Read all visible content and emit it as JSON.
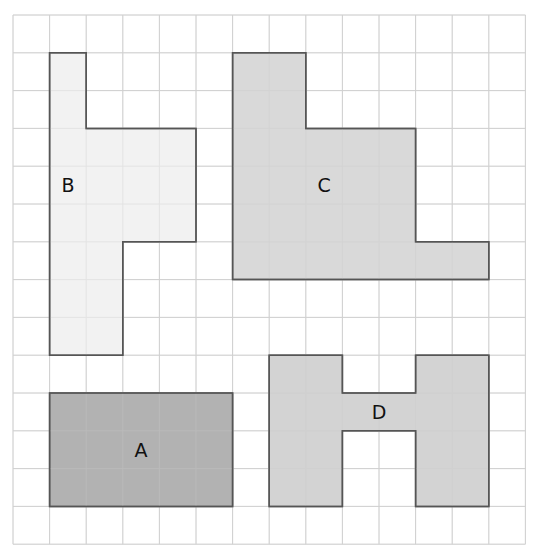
{
  "grid": {
    "origin_x": 13,
    "origin_y": 15,
    "cols": 14,
    "rows": 14,
    "cell_w": 36.6,
    "cell_h": 37.8,
    "line_color": "#d0d0d0",
    "background": "#ffffff"
  },
  "shapes": [
    {
      "id": "B",
      "label": "B",
      "fill": "#f1f1f1",
      "stroke": "#555555",
      "points": [
        [
          1,
          1
        ],
        [
          2,
          1
        ],
        [
          2,
          3
        ],
        [
          5,
          3
        ],
        [
          5,
          6
        ],
        [
          3,
          6
        ],
        [
          3,
          9
        ],
        [
          1,
          9
        ]
      ],
      "label_pos": [
        1.5,
        4.5
      ]
    },
    {
      "id": "C",
      "label": "C",
      "fill": "#d6d6d6",
      "stroke": "#555555",
      "points": [
        [
          6,
          1
        ],
        [
          8,
          1
        ],
        [
          8,
          3
        ],
        [
          11,
          3
        ],
        [
          11,
          6
        ],
        [
          13,
          6
        ],
        [
          13,
          7
        ],
        [
          6,
          7
        ]
      ],
      "label_pos": [
        8.5,
        4.5
      ]
    },
    {
      "id": "A",
      "label": "A",
      "fill": "#ababab",
      "stroke": "#555555",
      "points": [
        [
          1,
          10
        ],
        [
          6,
          10
        ],
        [
          6,
          13
        ],
        [
          1,
          13
        ]
      ],
      "label_pos": [
        3.5,
        11.5
      ]
    },
    {
      "id": "D",
      "label": "D",
      "fill": "#cfcfcf",
      "stroke": "#555555",
      "points": [
        [
          7,
          9
        ],
        [
          9,
          9
        ],
        [
          9,
          10
        ],
        [
          11,
          10
        ],
        [
          11,
          9
        ],
        [
          13,
          9
        ],
        [
          13,
          13
        ],
        [
          11,
          13
        ],
        [
          11,
          11
        ],
        [
          9,
          11
        ],
        [
          9,
          13
        ],
        [
          7,
          13
        ]
      ],
      "label_pos": [
        10,
        10.5
      ]
    }
  ]
}
